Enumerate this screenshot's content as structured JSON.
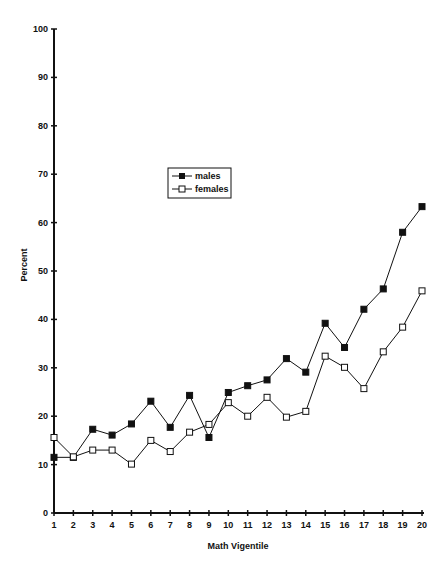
{
  "chart_data": {
    "type": "line",
    "title": "",
    "xlabel": "Math Vigentile",
    "ylabel": "Percent",
    "ylim": [
      0,
      100
    ],
    "yticks": [
      0,
      10,
      20,
      30,
      40,
      50,
      60,
      70,
      80,
      90,
      100
    ],
    "x": [
      1,
      2,
      3,
      4,
      5,
      6,
      7,
      8,
      9,
      10,
      11,
      12,
      13,
      14,
      15,
      16,
      17,
      18,
      19,
      20
    ],
    "grid": false,
    "legend_position": "upper-left-center (inside plot)",
    "series": [
      {
        "name": "males",
        "marker": "filled-square",
        "values": [
          11.5,
          11.5,
          17.3,
          16.1,
          18.4,
          23.1,
          17.7,
          24.3,
          15.6,
          24.9,
          26.3,
          27.5,
          31.9,
          29.1,
          39.2,
          34.2,
          42.1,
          46.3,
          58.0,
          63.3
        ]
      },
      {
        "name": "females",
        "marker": "open-square",
        "values": [
          15.6,
          11.6,
          13.0,
          13.0,
          10.1,
          15.0,
          12.7,
          16.7,
          18.3,
          22.8,
          20.0,
          23.9,
          19.8,
          21.0,
          32.4,
          30.1,
          25.7,
          33.3,
          38.4,
          45.9
        ]
      }
    ]
  },
  "legend": {
    "items": [
      {
        "label": "males"
      },
      {
        "label": "females"
      }
    ]
  },
  "colors": {
    "line": "#111111",
    "background": "#ffffff"
  }
}
